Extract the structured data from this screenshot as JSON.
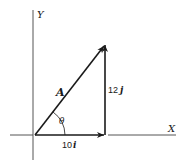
{
  "diagram": {
    "type": "vector-decomposition",
    "axes": {
      "x_label": "X",
      "y_label": "Y"
    },
    "vectors": [
      {
        "name": "A",
        "label": "A",
        "from": [
          0,
          0
        ],
        "to": [
          10,
          12
        ]
      },
      {
        "name": "x-component",
        "label_num": "10",
        "label_unit": "i",
        "from": [
          0,
          0
        ],
        "to": [
          10,
          0
        ]
      },
      {
        "name": "y-component",
        "label_num": "12",
        "label_unit": "j",
        "from": [
          10,
          0
        ],
        "to": [
          10,
          12
        ]
      }
    ],
    "angle_label": "θ",
    "colors": {
      "stroke": "#1a1a1a",
      "axis": "#555555",
      "background": "#ffffff"
    }
  }
}
